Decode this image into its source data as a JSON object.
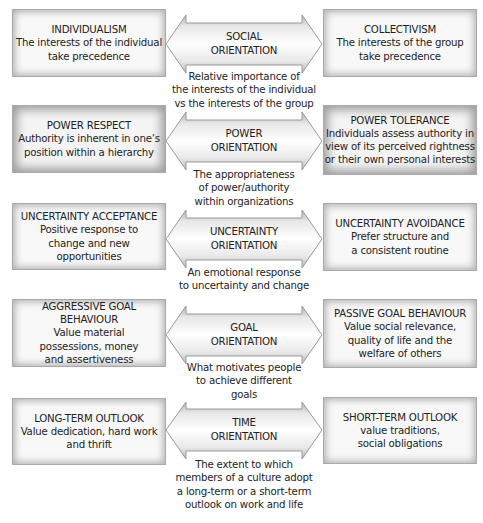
{
  "diagram": {
    "rows": [
      {
        "left": {
          "title": "INDIVIDUALISM",
          "desc": "The interests of the individual\ntake precedence"
        },
        "arrow": {
          "line1": "SOCIAL",
          "line2": "ORIENTATION"
        },
        "right": {
          "title": "COLLECTIVISM",
          "desc": "The interests of the group\ntake precedence"
        },
        "caption": "Relative importance of\nthe interests of the individual\nvs the interests of the group"
      },
      {
        "left": {
          "title": "POWER RESPECT",
          "desc": "Authority is inherent in one’s\nposition within a hierarchy"
        },
        "arrow": {
          "line1": "POWER",
          "line2": "ORIENTATION"
        },
        "right": {
          "title": "POWER TOLERANCE",
          "desc": "Individuals assess authority in\nview of its perceived rightness\nor their own personal interests"
        },
        "caption": "The appropriateness\nof power/authority\nwithin organizations"
      },
      {
        "left": {
          "title": "UNCERTAINTY ACCEPTANCE",
          "desc": "Positive response to\nchange and new\nopportunities"
        },
        "arrow": {
          "line1": "UNCERTAINTY",
          "line2": "ORIENTATION"
        },
        "right": {
          "title": "UNCERTAINTY AVOIDANCE",
          "desc": "Prefer structure and\na consistent routine"
        },
        "caption": "An emotional response\nto uncertainty and change"
      },
      {
        "left": {
          "title": "AGGRESSIVE GOAL BEHAVIOUR",
          "desc": "Value material\npossessions, money\nand assertiveness"
        },
        "arrow": {
          "line1": "GOAL",
          "line2": "ORIENTATION"
        },
        "right": {
          "title": "PASSIVE GOAL BEHAVIOUR",
          "desc": "Value social relevance,\nquality of life and the\nwelfare of others"
        },
        "caption": "What motivates people\nto achieve different\ngoals"
      },
      {
        "left": {
          "title": "LONG-TERM OUTLOOK",
          "desc": "Value dedication, hard work\nand thrift"
        },
        "arrow": {
          "line1": "TIME",
          "line2": "ORIENTATION"
        },
        "right": {
          "title": "SHORT-TERM OUTLOOK",
          "desc": "value traditions,\nsocial obligations"
        },
        "caption": "The extent to which\nmembers of a culture adopt\na long-term or a short-term\noutlook on work and life"
      }
    ]
  },
  "colors": {
    "text": "#232323",
    "box_border": "#a9a9a9",
    "box_fill": "#f8f8f8",
    "arrow_edge": "#9a9a9a",
    "arrow_center": "#ffffff"
  }
}
